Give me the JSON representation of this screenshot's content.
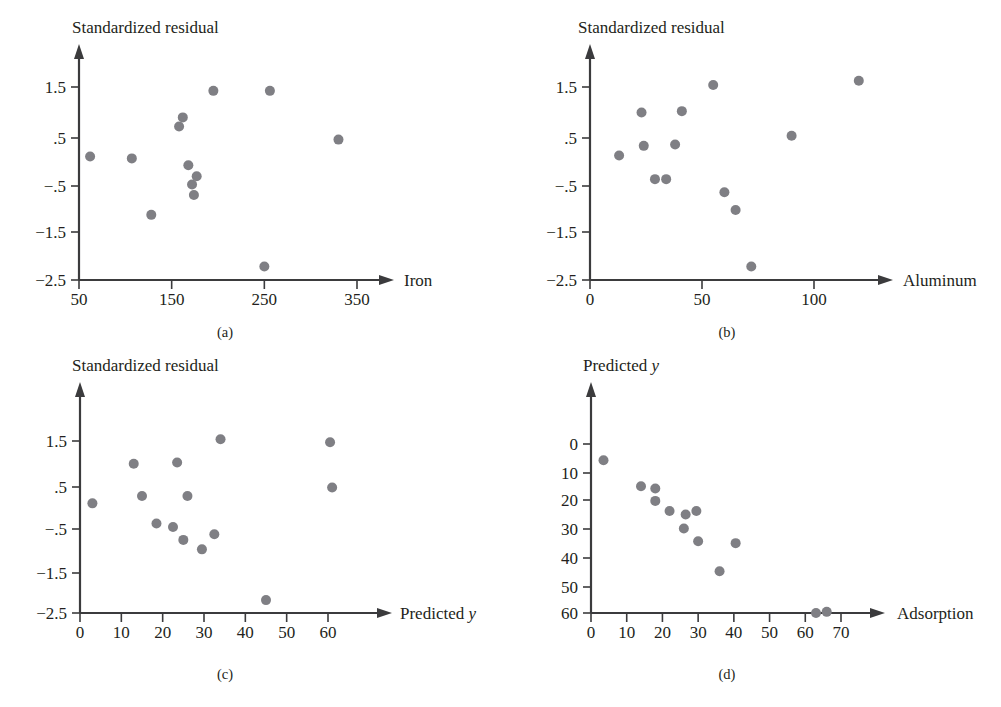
{
  "figure": {
    "background_color": "#ffffff",
    "ink_color": "#231f20",
    "axis_color": "#3b3b3d",
    "marker_color": "#7f7f84"
  },
  "chart_data": [
    {
      "id": "a",
      "type": "scatter",
      "caption": "(a)",
      "title": "",
      "ylabel": "Standardized residual",
      "xlabel": "Iron",
      "xlabel_italic": false,
      "xticks": [
        50,
        150,
        250,
        350
      ],
      "xticklabels": [
        "50",
        "150",
        "250",
        "350"
      ],
      "yticks": [
        1.5,
        0.5,
        -0.5,
        -1.5,
        -2.5
      ],
      "yticklabels": [
        "1.5",
        ".5",
        "−.5",
        "−1.5",
        "−2.5"
      ],
      "xlim": [
        33,
        400
      ],
      "ylim": [
        -2.5,
        2.15
      ],
      "grid": false,
      "legend": "none",
      "x": [
        62,
        107,
        128,
        158,
        162,
        168,
        172,
        174,
        177,
        195,
        250,
        256,
        330
      ],
      "y": [
        0.06,
        0.02,
        -1.15,
        0.68,
        0.87,
        -0.12,
        -0.52,
        -0.74,
        -0.35,
        1.42,
        -2.22,
        1.42,
        0.41
      ]
    },
    {
      "id": "b",
      "type": "scatter",
      "caption": "(b)",
      "title": "",
      "ylabel": "Standardized residual",
      "xlabel": "Aluminum",
      "xlabel_italic": false,
      "xticks": [
        0,
        50,
        100
      ],
      "xticklabels": [
        "0",
        "50",
        "100"
      ],
      "yticks": [
        1.5,
        0.5,
        -0.5,
        -1.5,
        -2.5
      ],
      "yticklabels": [
        "1.5",
        ".5",
        "−.5",
        "−1.5",
        "−2.5"
      ],
      "xlim": [
        -6,
        136
      ],
      "ylim": [
        -2.5,
        2.15
      ],
      "grid": false,
      "legend": "none",
      "x": [
        13,
        23,
        24,
        29,
        34,
        38,
        41,
        55,
        60,
        65,
        72,
        90,
        120
      ],
      "y": [
        0.08,
        0.97,
        0.28,
        -0.41,
        -0.41,
        0.31,
        1.0,
        1.54,
        -0.68,
        -1.05,
        -2.22,
        0.49,
        1.63
      ]
    },
    {
      "id": "c",
      "type": "scatter",
      "caption": "(c)",
      "title": "",
      "ylabel": "Standardized residual",
      "xlabel": "Predicted y",
      "xlabel_italic": true,
      "xticks": [
        0,
        10,
        20,
        30,
        40,
        50,
        60
      ],
      "xticklabels": [
        "0",
        "10",
        "20",
        "30",
        "40",
        "50",
        "60"
      ],
      "yticks": [
        1.5,
        0.5,
        -0.5,
        -1.5,
        -2.5
      ],
      "yticklabels": [
        "1.5",
        ".5",
        "−.5",
        "−1.5",
        "−2.5"
      ],
      "xlim": [
        -2,
        72
      ],
      "ylim": [
        -2.5,
        2.15
      ],
      "grid": false,
      "legend": "none",
      "x": [
        3,
        13,
        15,
        23.5,
        26,
        18.5,
        22.5,
        25,
        29.5,
        32.5,
        34,
        45,
        60.5,
        61
      ],
      "y": [
        0.05,
        0.97,
        0.22,
        1.0,
        0.22,
        -0.42,
        -0.5,
        -0.8,
        -1.02,
        -0.67,
        1.54,
        -2.2,
        1.47,
        0.42
      ]
    },
    {
      "id": "d",
      "type": "scatter",
      "caption": "(d)",
      "title": "",
      "ylabel": "Predicted y",
      "ylabel_italic": true,
      "xlabel": "Adsorption",
      "xlabel_italic": false,
      "xticks": [
        0,
        10,
        20,
        30,
        40,
        50,
        60,
        70
      ],
      "xticklabels": [
        "0",
        "10",
        "20",
        "30",
        "40",
        "50",
        "60",
        "70"
      ],
      "yticks": [
        0,
        10,
        20,
        30,
        40,
        50,
        60
      ],
      "yticklabels": [
        "0",
        "10",
        "20",
        "30",
        "40",
        "50",
        "60"
      ],
      "xlim": [
        -2,
        82
      ],
      "ylim": [
        0,
        72
      ],
      "grid": false,
      "legend": "none",
      "x": [
        3.5,
        14,
        18,
        18,
        22,
        26,
        26.5,
        29.5,
        30,
        36,
        40.5,
        63,
        66
      ],
      "y": [
        5.8,
        15,
        20.2,
        15.8,
        23.8,
        30,
        25,
        23.8,
        34.5,
        45.2,
        35.2,
        60,
        59.6
      ]
    }
  ]
}
